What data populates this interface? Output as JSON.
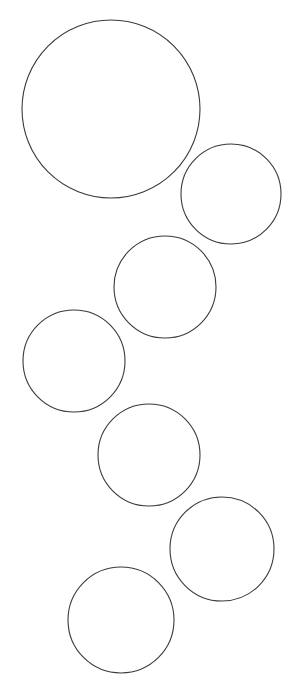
{
  "figure": {
    "title": "",
    "background_color": "#ffffff",
    "width": 299,
    "height": 692,
    "stroke_color": "#3a3a3a",
    "stroke_width": 1.1,
    "fill": "none",
    "shape_kind": "circle-outline",
    "shape_count": 7,
    "count_label": "7"
  },
  "chart_data": {
    "type": "scatter",
    "title": "",
    "subtitle": "",
    "xlabel": "",
    "ylabel": "",
    "xlim": [
      0,
      299
    ],
    "ylim": [
      0,
      692
    ],
    "grid": false,
    "legend": [],
    "annotations": [],
    "marker": "open-circle",
    "units": "px",
    "circles": [
      {
        "id": "circle-1",
        "label": "1",
        "cx": 111,
        "cy": 109,
        "r": 89,
        "diameter": 178
      },
      {
        "id": "circle-2",
        "label": "2",
        "cx": 231,
        "cy": 194,
        "r": 50,
        "diameter": 100
      },
      {
        "id": "circle-3",
        "label": "3",
        "cx": 165,
        "cy": 287,
        "r": 51,
        "diameter": 102
      },
      {
        "id": "circle-4",
        "label": "4",
        "cx": 74,
        "cy": 361,
        "r": 51,
        "diameter": 102
      },
      {
        "id": "circle-5",
        "label": "5",
        "cx": 149,
        "cy": 455,
        "r": 51,
        "diameter": 102
      },
      {
        "id": "circle-6",
        "label": "6",
        "cx": 222,
        "cy": 549,
        "r": 52,
        "diameter": 104
      },
      {
        "id": "circle-7",
        "label": "7",
        "cx": 121,
        "cy": 620,
        "r": 53,
        "diameter": 106
      }
    ]
  }
}
